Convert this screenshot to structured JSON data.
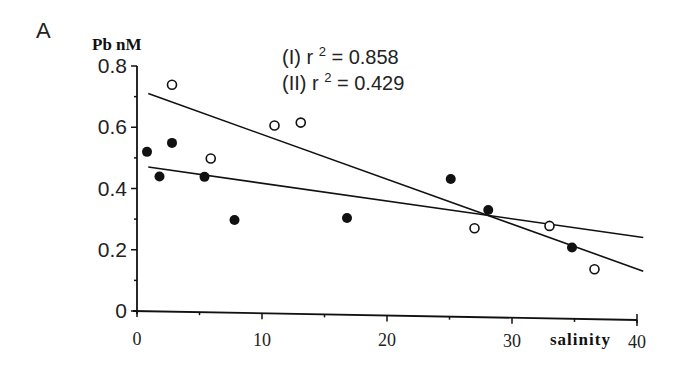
{
  "panel_label": "A",
  "chart_data": {
    "type": "scatter",
    "title": "",
    "xlabel": "salinity",
    "ylabel": "Pb nM",
    "xlim": [
      0,
      40
    ],
    "ylim": [
      0,
      0.8
    ],
    "x_ticks": [
      0,
      10,
      20,
      30,
      40
    ],
    "x_tick_labels": [
      "0",
      "10",
      "20",
      "30",
      "40"
    ],
    "y_ticks": [
      0,
      0.2,
      0.4,
      0.6,
      0.8
    ],
    "y_tick_labels": [
      "0",
      "0.2",
      "0.4",
      "0.6",
      "0.8"
    ],
    "grid": false,
    "legend": "none",
    "annotations": [
      {
        "label": "(I) r",
        "sup": "2",
        "rest": " = 0.858"
      },
      {
        "label": "(II) r",
        "sup": "2",
        "rest": " = 0.429"
      }
    ],
    "series": [
      {
        "name": "I (open circles)",
        "marker": "open-circle",
        "r2": 0.858,
        "points": [
          {
            "x": 2.8,
            "y": 0.74
          },
          {
            "x": 5.9,
            "y": 0.5
          },
          {
            "x": 11.0,
            "y": 0.61
          },
          {
            "x": 13.1,
            "y": 0.62
          },
          {
            "x": 27.0,
            "y": 0.28
          },
          {
            "x": 33.0,
            "y": 0.29
          },
          {
            "x": 36.6,
            "y": 0.15
          }
        ],
        "fit_line": {
          "x0": 0.9,
          "y0": 0.71,
          "x1": 40.5,
          "y1": 0.13
        }
      },
      {
        "name": "II (filled circles)",
        "marker": "filled-circle",
        "r2": 0.429,
        "points": [
          {
            "x": 0.8,
            "y": 0.52
          },
          {
            "x": 1.8,
            "y": 0.44
          },
          {
            "x": 2.8,
            "y": 0.55
          },
          {
            "x": 5.4,
            "y": 0.44
          },
          {
            "x": 7.8,
            "y": 0.3
          },
          {
            "x": 16.8,
            "y": 0.31
          },
          {
            "x": 25.1,
            "y": 0.44
          },
          {
            "x": 28.1,
            "y": 0.34
          },
          {
            "x": 34.8,
            "y": 0.22
          }
        ],
        "fit_line": {
          "x0": 0.9,
          "y0": 0.47,
          "x1": 40.5,
          "y1": 0.24
        }
      }
    ]
  },
  "colors": {
    "ink": "#111111",
    "background": "#ffffff"
  }
}
